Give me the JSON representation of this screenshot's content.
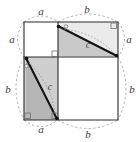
{
  "figure": {
    "background_color": "#ffffff",
    "stroke_color": "#1a1a1a",
    "dash_color": "#9a9a9a",
    "fill_square_a": "#ffffff",
    "fill_square_b": "#e8e8e8",
    "fill_triangle_light": "#cccccc",
    "fill_triangle_dark": "#b4b4b4",
    "labels": {
      "top_left": "a",
      "top_right": "b",
      "right_top": "a",
      "right_bottom": "b",
      "bottom_left": "a",
      "bottom_right": "b",
      "left_top": "a",
      "left_bottom": "b",
      "hyp_top": "c",
      "hyp_bottom": "c"
    },
    "geometry": {
      "outer_left": 24,
      "outer_top": 22,
      "outer_right": 118,
      "outer_bottom": 120,
      "cross_x": 58,
      "cross_y": 57,
      "side_a": 34,
      "side_b": 60
    }
  }
}
